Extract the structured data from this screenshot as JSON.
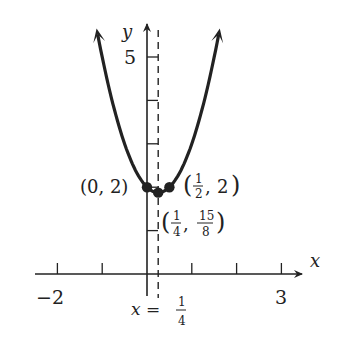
{
  "chart_data": {
    "type": "line",
    "title": "",
    "function": "y = 2x^2 - x + 2",
    "xlabel": "x",
    "ylabel": "y",
    "xlim": [
      -2.5,
      3.6
    ],
    "ylim": [
      -0.8,
      5.7
    ],
    "x_ticks": [
      -2,
      -1,
      0,
      1,
      2,
      3
    ],
    "x_tick_labels": [
      {
        "value": -2,
        "label": "−2"
      },
      {
        "value": 3,
        "label": "3"
      }
    ],
    "y_ticks": [
      1,
      2,
      3,
      4,
      5
    ],
    "y_tick_labels": [
      {
        "value": 5,
        "label": "5"
      }
    ],
    "curve_domain": [
      -1.1,
      1.6
    ],
    "axis_of_symmetry": {
      "x": 0.25,
      "label_lhs": "x =",
      "label_num": "1",
      "label_den": "4"
    },
    "points": [
      {
        "x": 0,
        "y": 2,
        "label": "(0, 2)"
      },
      {
        "x": 0.5,
        "y": 2,
        "label_parts": [
          "1",
          "2",
          "2"
        ]
      },
      {
        "x": 0.25,
        "y": 1.875,
        "label_parts": [
          "1",
          "4",
          "15",
          "8"
        ]
      }
    ],
    "color": "#222222"
  }
}
